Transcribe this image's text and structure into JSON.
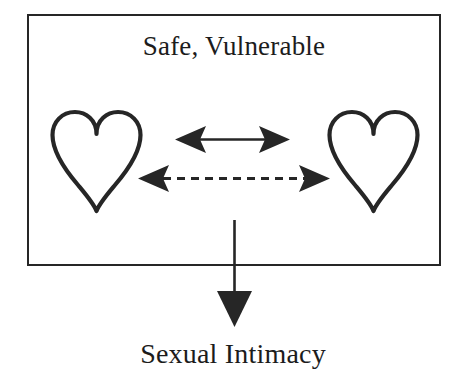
{
  "diagram": {
    "type": "conceptual-relationship-diagram",
    "title": "Safe, Vulnerable",
    "outcome_label": "Sexual Intimacy",
    "background_color": "#ffffff",
    "stroke_color": "#262626",
    "text_color": "#1c1c1c",
    "container": {
      "name": "safe-vulnerable-box",
      "shape": "rectangle",
      "x": 27,
      "y": 14,
      "width": 414,
      "height": 252,
      "border_width": 2.5,
      "border_color": "#262626",
      "fill": "#ffffff"
    },
    "nodes": [
      {
        "name": "heart-left",
        "icon": "heart-outline-icon",
        "label": "",
        "x": 53,
        "y": 113,
        "width": 87,
        "height": 97,
        "filled": false,
        "stroke_color": "#262626",
        "stroke_width": 4
      },
      {
        "name": "heart-right",
        "icon": "heart-outline-icon",
        "label": "",
        "x": 330,
        "y": 113,
        "width": 87,
        "height": 97,
        "filled": false,
        "stroke_color": "#262626",
        "stroke_width": 4
      }
    ],
    "connectors": [
      {
        "name": "solid-bidirectional-arrow",
        "style": "solid",
        "direction": "bidirectional",
        "x1": 175,
        "y1": 139,
        "x2": 290,
        "y2": 139,
        "stroke_color": "#262626",
        "stroke_width": 2.5
      },
      {
        "name": "dashed-bidirectional-arrow",
        "style": "dashed",
        "direction": "bidirectional",
        "x1": 138,
        "y1": 178,
        "x2": 330,
        "y2": 178,
        "stroke_color": "#262626",
        "stroke_width": 3,
        "dash_pattern": "8 6"
      },
      {
        "name": "downward-outcome-arrow",
        "style": "solid",
        "direction": "down",
        "x1": 234,
        "y1": 220,
        "x2": 234,
        "y2": 327,
        "stroke_color": "#262626",
        "stroke_width": 2.5
      }
    ]
  }
}
